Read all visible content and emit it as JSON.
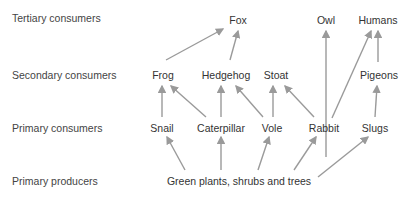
{
  "levels": [
    {
      "id": "tertiary",
      "label": "Tertiary consumers"
    },
    {
      "id": "secondary",
      "label": "Secondary consumers"
    },
    {
      "id": "primary",
      "label": "Primary consumers"
    },
    {
      "id": "producers",
      "label": "Primary producers"
    }
  ],
  "nodes": {
    "fox": "Fox",
    "owl": "Owl",
    "humans": "Humans",
    "frog": "Frog",
    "hedgehog": "Hedgehog",
    "stoat": "Stoat",
    "pigeons": "Pigeons",
    "snail": "Snail",
    "caterpillar": "Caterpillar",
    "vole": "Vole",
    "rabbit": "Rabbit",
    "slugs": "Slugs",
    "plants": "Green plants, shrubs and trees"
  },
  "edges": [
    [
      "frog",
      "fox"
    ],
    [
      "hedgehog",
      "fox"
    ],
    [
      "snail",
      "frog"
    ],
    [
      "caterpillar",
      "frog"
    ],
    [
      "caterpillar",
      "hedgehog"
    ],
    [
      "vole",
      "hedgehog"
    ],
    [
      "vole",
      "stoat"
    ],
    [
      "rabbit",
      "stoat"
    ],
    [
      "rabbit",
      "owl"
    ],
    [
      "rabbit",
      "humans"
    ],
    [
      "pigeons",
      "humans"
    ],
    [
      "slugs",
      "pigeons"
    ],
    [
      "plants",
      "snail"
    ],
    [
      "plants",
      "caterpillar"
    ],
    [
      "plants",
      "vole"
    ],
    [
      "plants",
      "rabbit"
    ],
    [
      "plants",
      "slugs"
    ]
  ],
  "colors": {
    "arrow": "#9a9a9a",
    "text": "#333333"
  }
}
